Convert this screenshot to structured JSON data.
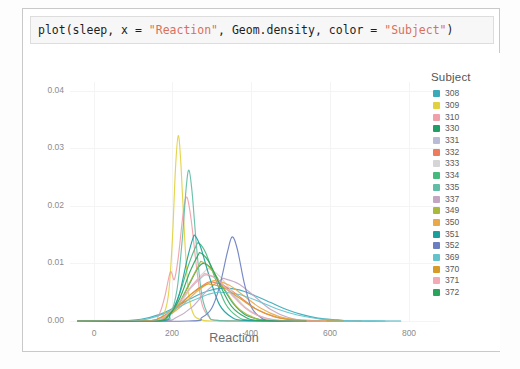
{
  "code_cell": {
    "tokens": [
      {
        "t": "plot(sleep, x = ",
        "k": "plain"
      },
      {
        "t": "\"Reaction\"",
        "k": "str"
      },
      {
        "t": ", Geom.density, color = ",
        "k": "plain"
      },
      {
        "t": "\"Subject\"",
        "k": "str"
      },
      {
        "t": ")",
        "k": "plain"
      }
    ],
    "full_text": "plot(sleep, x = \"Reaction\", Geom.density, color = \"Subject\")"
  },
  "legend": {
    "title": "Subject",
    "items": [
      {
        "label": "308",
        "color": "#3aa9b8"
      },
      {
        "label": "309",
        "color": "#e2d13f"
      },
      {
        "label": "310",
        "color": "#f0a0a8"
      },
      {
        "label": "330",
        "color": "#1f9e68"
      },
      {
        "label": "331",
        "color": "#b9bcd4"
      },
      {
        "label": "332",
        "color": "#ef7b5d"
      },
      {
        "label": "333",
        "color": "#d5d5d5"
      },
      {
        "label": "334",
        "color": "#46b97e"
      },
      {
        "label": "335",
        "color": "#61bda5"
      },
      {
        "label": "337",
        "color": "#c2a6c2"
      },
      {
        "label": "349",
        "color": "#a9b93c"
      },
      {
        "label": "350",
        "color": "#e9a94a"
      },
      {
        "label": "351",
        "color": "#1a9e9e"
      },
      {
        "label": "352",
        "color": "#6b7fc0"
      },
      {
        "label": "369",
        "color": "#62c3cd"
      },
      {
        "label": "370",
        "color": "#d79b28"
      },
      {
        "label": "371",
        "color": "#f3aab4"
      },
      {
        "label": "372",
        "color": "#2aa35c"
      }
    ]
  },
  "caption": "",
  "chart_data": {
    "type": "line",
    "title": "",
    "xlabel": "Reaction",
    "ylabel": "",
    "xlim": [
      -60,
      880
    ],
    "ylim": [
      0,
      0.0415
    ],
    "xticks": [
      0,
      200,
      400,
      600,
      800
    ],
    "xticklabels": [
      "0",
      "200",
      "400",
      "600",
      "800"
    ],
    "yticks": [
      0.0,
      0.01,
      0.02,
      0.03,
      0.04
    ],
    "yticklabels": [
      "0.00",
      "0.01",
      "0.02",
      "0.03",
      "0.04"
    ],
    "grid": true,
    "legend_position": "right",
    "legend_title": "Subject",
    "series": [
      {
        "name": "308",
        "color": "#3aa9b8",
        "mean": 330,
        "sd": 70,
        "peak": 0.0057,
        "points": [
          [
            60,
            0.0
          ],
          [
            120,
            0.0003
          ],
          [
            170,
            0.0012
          ],
          [
            210,
            0.0025
          ],
          [
            250,
            0.004
          ],
          [
            290,
            0.0052
          ],
          [
            330,
            0.0057
          ],
          [
            370,
            0.0054
          ],
          [
            410,
            0.0044
          ],
          [
            450,
            0.0032
          ],
          [
            490,
            0.002
          ],
          [
            530,
            0.0011
          ],
          [
            570,
            0.0005
          ],
          [
            620,
            0.0002
          ],
          [
            660,
            0.0
          ]
        ]
      },
      {
        "name": "309",
        "color": "#e2d13f",
        "mean": 215,
        "sd": 16,
        "peak": 0.0322,
        "points": [
          [
            150,
            0.0
          ],
          [
            175,
            0.0008
          ],
          [
            190,
            0.0045
          ],
          [
            200,
            0.014
          ],
          [
            208,
            0.0265
          ],
          [
            215,
            0.0322
          ],
          [
            222,
            0.027
          ],
          [
            232,
            0.0135
          ],
          [
            242,
            0.0045
          ],
          [
            255,
            0.001
          ],
          [
            275,
            0.0002
          ],
          [
            300,
            0.0
          ]
        ]
      },
      {
        "name": "310",
        "color": "#f0a0a8",
        "mean": 237,
        "sd": 24,
        "peak": 0.0215,
        "points": [
          [
            140,
            0.0
          ],
          [
            165,
            0.001
          ],
          [
            180,
            0.004
          ],
          [
            195,
            0.0085
          ],
          [
            205,
            0.0072
          ],
          [
            215,
            0.011
          ],
          [
            228,
            0.019
          ],
          [
            237,
            0.0215
          ],
          [
            248,
            0.0175
          ],
          [
            262,
            0.009
          ],
          [
            275,
            0.003
          ],
          [
            292,
            0.0008
          ],
          [
            315,
            0.0001
          ]
        ]
      },
      {
        "name": "330",
        "color": "#1f9e68",
        "mean": 280,
        "sd": 42,
        "peak": 0.01,
        "points": [
          [
            150,
            0.0
          ],
          [
            180,
            0.0005
          ],
          [
            210,
            0.0022
          ],
          [
            240,
            0.006
          ],
          [
            265,
            0.0092
          ],
          [
            280,
            0.01
          ],
          [
            300,
            0.009
          ],
          [
            325,
            0.0062
          ],
          [
            355,
            0.003
          ],
          [
            385,
            0.0011
          ],
          [
            420,
            0.0003
          ],
          [
            460,
            0.0
          ]
        ]
      },
      {
        "name": "331",
        "color": "#b9bcd4",
        "mean": 288,
        "sd": 50,
        "peak": 0.008,
        "points": [
          [
            140,
            0.0
          ],
          [
            175,
            0.0006
          ],
          [
            210,
            0.0025
          ],
          [
            245,
            0.0056
          ],
          [
            275,
            0.0076
          ],
          [
            288,
            0.008
          ],
          [
            315,
            0.0072
          ],
          [
            350,
            0.0048
          ],
          [
            385,
            0.0024
          ],
          [
            420,
            0.0009
          ],
          [
            460,
            0.0002
          ],
          [
            500,
            0.0
          ]
        ]
      },
      {
        "name": "332",
        "color": "#ef7b5d",
        "mean": 300,
        "sd": 60,
        "peak": 0.0068,
        "points": [
          [
            130,
            0.0
          ],
          [
            170,
            0.0006
          ],
          [
            210,
            0.0022
          ],
          [
            250,
            0.0048
          ],
          [
            285,
            0.0065
          ],
          [
            300,
            0.0068
          ],
          [
            335,
            0.006
          ],
          [
            375,
            0.004
          ],
          [
            415,
            0.002
          ],
          [
            460,
            0.0007
          ],
          [
            510,
            0.0002
          ],
          [
            560,
            0.0
          ]
        ]
      },
      {
        "name": "333",
        "color": "#d5d5d5",
        "mean": 295,
        "sd": 45,
        "peak": 0.009,
        "points": [
          [
            150,
            0.0
          ],
          [
            185,
            0.0008
          ],
          [
            220,
            0.003
          ],
          [
            255,
            0.0066
          ],
          [
            285,
            0.0088
          ],
          [
            295,
            0.009
          ],
          [
            320,
            0.0078
          ],
          [
            355,
            0.0048
          ],
          [
            390,
            0.002
          ],
          [
            430,
            0.0006
          ],
          [
            470,
            0.0001
          ]
        ]
      },
      {
        "name": "334",
        "color": "#46b97e",
        "mean": 268,
        "sd": 33,
        "peak": 0.0135,
        "points": [
          [
            160,
            0.0
          ],
          [
            190,
            0.0009
          ],
          [
            215,
            0.004
          ],
          [
            240,
            0.0095
          ],
          [
            260,
            0.013
          ],
          [
            268,
            0.0135
          ],
          [
            285,
            0.0118
          ],
          [
            310,
            0.0072
          ],
          [
            335,
            0.003
          ],
          [
            365,
            0.0008
          ],
          [
            400,
            0.0001
          ]
        ]
      },
      {
        "name": "335",
        "color": "#61bda5",
        "mean": 242,
        "sd": 20,
        "peak": 0.0262,
        "points": [
          [
            170,
            0.0
          ],
          [
            195,
            0.0012
          ],
          [
            212,
            0.0055
          ],
          [
            225,
            0.014
          ],
          [
            235,
            0.023
          ],
          [
            242,
            0.0262
          ],
          [
            250,
            0.0225
          ],
          [
            262,
            0.0125
          ],
          [
            275,
            0.0045
          ],
          [
            292,
            0.001
          ],
          [
            315,
            0.0001
          ]
        ]
      },
      {
        "name": "337",
        "color": "#c2a6c2",
        "mean": 335,
        "sd": 55,
        "peak": 0.0073,
        "points": [
          [
            170,
            0.0
          ],
          [
            210,
            0.0006
          ],
          [
            250,
            0.0024
          ],
          [
            290,
            0.0054
          ],
          [
            325,
            0.0072
          ],
          [
            335,
            0.0073
          ],
          [
            370,
            0.0064
          ],
          [
            410,
            0.0042
          ],
          [
            450,
            0.002
          ],
          [
            495,
            0.0006
          ],
          [
            540,
            0.0001
          ]
        ]
      },
      {
        "name": "349",
        "color": "#a9b93c",
        "mean": 275,
        "sd": 40,
        "peak": 0.0103,
        "points": [
          [
            150,
            0.0
          ],
          [
            185,
            0.0007
          ],
          [
            215,
            0.0028
          ],
          [
            245,
            0.0068
          ],
          [
            268,
            0.0098
          ],
          [
            275,
            0.0103
          ],
          [
            298,
            0.009
          ],
          [
            330,
            0.0058
          ],
          [
            362,
            0.0026
          ],
          [
            400,
            0.0008
          ],
          [
            440,
            0.0001
          ]
        ]
      },
      {
        "name": "350",
        "color": "#e9a94a",
        "mean": 310,
        "sd": 58,
        "peak": 0.007,
        "points": [
          [
            140,
            0.0
          ],
          [
            180,
            0.0006
          ],
          [
            220,
            0.0024
          ],
          [
            260,
            0.005
          ],
          [
            295,
            0.0067
          ],
          [
            310,
            0.007
          ],
          [
            345,
            0.0062
          ],
          [
            385,
            0.0042
          ],
          [
            425,
            0.0022
          ],
          [
            470,
            0.0008
          ],
          [
            520,
            0.0002
          ]
        ]
      },
      {
        "name": "351",
        "color": "#1a9e9e",
        "mean": 258,
        "sd": 30,
        "peak": 0.0148,
        "points": [
          [
            165,
            0.0
          ],
          [
            195,
            0.0012
          ],
          [
            218,
            0.0048
          ],
          [
            238,
            0.0108
          ],
          [
            252,
            0.0143
          ],
          [
            258,
            0.0148
          ],
          [
            272,
            0.0128
          ],
          [
            295,
            0.0075
          ],
          [
            320,
            0.0028
          ],
          [
            350,
            0.0007
          ],
          [
            385,
            0.0001
          ]
        ]
      },
      {
        "name": "352",
        "color": "#6b7fc0",
        "mean": 352,
        "sd": 22,
        "peak": 0.0146,
        "points": [
          [
            240,
            0.0
          ],
          [
            275,
            0.0006
          ],
          [
            300,
            0.0022
          ],
          [
            320,
            0.006
          ],
          [
            340,
            0.012
          ],
          [
            352,
            0.0146
          ],
          [
            365,
            0.0125
          ],
          [
            382,
            0.0068
          ],
          [
            400,
            0.0025
          ],
          [
            425,
            0.0006
          ],
          [
            455,
            0.0001
          ]
        ]
      },
      {
        "name": "369",
        "color": "#62c3cd",
        "mean": 320,
        "sd": 80,
        "peak": 0.005,
        "points": [
          [
            90,
            0.0
          ],
          [
            140,
            0.0004
          ],
          [
            190,
            0.0016
          ],
          [
            240,
            0.0032
          ],
          [
            290,
            0.0046
          ],
          [
            320,
            0.005
          ],
          [
            370,
            0.0046
          ],
          [
            420,
            0.0034
          ],
          [
            470,
            0.002
          ],
          [
            520,
            0.001
          ],
          [
            570,
            0.0004
          ],
          [
            620,
            0.0001
          ]
        ]
      },
      {
        "name": "370",
        "color": "#d79b28",
        "mean": 295,
        "sd": 62,
        "peak": 0.0064,
        "points": [
          [
            130,
            0.0
          ],
          [
            170,
            0.0006
          ],
          [
            210,
            0.0024
          ],
          [
            250,
            0.0048
          ],
          [
            282,
            0.0062
          ],
          [
            295,
            0.0064
          ],
          [
            330,
            0.0058
          ],
          [
            370,
            0.004
          ],
          [
            415,
            0.002
          ],
          [
            465,
            0.0007
          ],
          [
            515,
            0.0001
          ]
        ]
      },
      {
        "name": "371",
        "color": "#f3aab4",
        "mean": 285,
        "sd": 48,
        "peak": 0.0082,
        "points": [
          [
            145,
            0.0
          ],
          [
            180,
            0.0008
          ],
          [
            215,
            0.003
          ],
          [
            250,
            0.0062
          ],
          [
            278,
            0.008
          ],
          [
            285,
            0.0082
          ],
          [
            315,
            0.0072
          ],
          [
            350,
            0.0046
          ],
          [
            388,
            0.0021
          ],
          [
            428,
            0.0007
          ],
          [
            470,
            0.0001
          ]
        ]
      },
      {
        "name": "372",
        "color": "#2aa35c",
        "mean": 272,
        "sd": 36,
        "peak": 0.0118,
        "points": [
          [
            155,
            0.0
          ],
          [
            190,
            0.001
          ],
          [
            218,
            0.0038
          ],
          [
            245,
            0.0086
          ],
          [
            265,
            0.0114
          ],
          [
            272,
            0.0118
          ],
          [
            292,
            0.0104
          ],
          [
            320,
            0.0064
          ],
          [
            350,
            0.0026
          ],
          [
            385,
            0.0007
          ],
          [
            420,
            0.0001
          ]
        ]
      }
    ]
  }
}
